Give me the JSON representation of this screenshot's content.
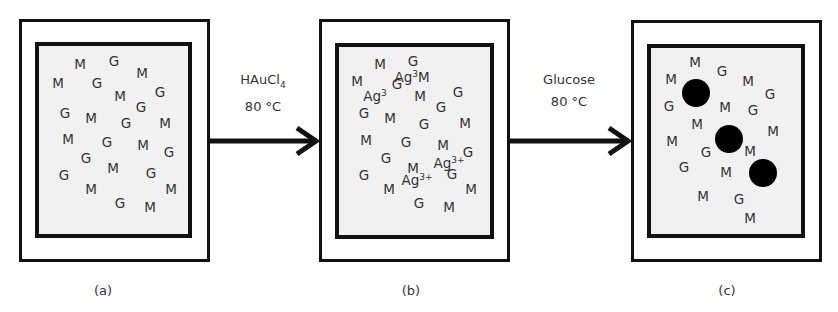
{
  "panels": [
    {
      "caption": "(a)",
      "outer": [
        19,
        19,
        191,
        243
      ],
      "inner": [
        35,
        42,
        157,
        196
      ],
      "items": [
        {
          "t": "M",
          "x": 80,
          "y": 65
        },
        {
          "t": "G",
          "x": 114,
          "y": 62
        },
        {
          "t": "M",
          "x": 142,
          "y": 74
        },
        {
          "t": "M",
          "x": 58,
          "y": 84
        },
        {
          "t": "G",
          "x": 97,
          "y": 84
        },
        {
          "t": "M",
          "x": 120,
          "y": 97
        },
        {
          "t": "G",
          "x": 160,
          "y": 93
        },
        {
          "t": "G",
          "x": 65,
          "y": 114
        },
        {
          "t": "M",
          "x": 91,
          "y": 119
        },
        {
          "t": "G",
          "x": 141,
          "y": 108
        },
        {
          "t": "G",
          "x": 126,
          "y": 124
        },
        {
          "t": "M",
          "x": 165,
          "y": 124
        },
        {
          "t": "M",
          "x": 68,
          "y": 140
        },
        {
          "t": "G",
          "x": 107,
          "y": 143
        },
        {
          "t": "M",
          "x": 143,
          "y": 146
        },
        {
          "t": "G",
          "x": 169,
          "y": 153
        },
        {
          "t": "G",
          "x": 86,
          "y": 159
        },
        {
          "t": "M",
          "x": 113,
          "y": 169
        },
        {
          "t": "G",
          "x": 151,
          "y": 174
        },
        {
          "t": "G",
          "x": 64,
          "y": 176
        },
        {
          "t": "M",
          "x": 91,
          "y": 190
        },
        {
          "t": "M",
          "x": 171,
          "y": 190
        },
        {
          "t": "G",
          "x": 120,
          "y": 204
        },
        {
          "t": "M",
          "x": 150,
          "y": 208
        }
      ],
      "dots": []
    },
    {
      "caption": "(b)",
      "outer": [
        319,
        19,
        191,
        243
      ],
      "inner": [
        335,
        43,
        159,
        196
      ],
      "items": [
        {
          "t": "M",
          "x": 380,
          "y": 65
        },
        {
          "t": "G",
          "x": 413,
          "y": 62
        },
        {
          "t": "M",
          "x": 357,
          "y": 82
        },
        {
          "t": "G",
          "x": 397,
          "y": 85
        },
        {
          "t": "Ag",
          "sup": "3",
          "x": 375,
          "y": 96
        },
        {
          "t": "Ag",
          "sup": "3",
          "after": "M",
          "x": 412,
          "y": 77
        },
        {
          "t": "M",
          "x": 420,
          "y": 97
        },
        {
          "t": "G",
          "x": 458,
          "y": 93
        },
        {
          "t": "G",
          "x": 364,
          "y": 114
        },
        {
          "t": "M",
          "x": 390,
          "y": 119
        },
        {
          "t": "G",
          "x": 441,
          "y": 108
        },
        {
          "t": "G",
          "x": 424,
          "y": 125
        },
        {
          "t": "M",
          "x": 465,
          "y": 124
        },
        {
          "t": "M",
          "x": 366,
          "y": 141
        },
        {
          "t": "G",
          "x": 406,
          "y": 143
        },
        {
          "t": "M",
          "x": 443,
          "y": 146
        },
        {
          "t": "G",
          "x": 468,
          "y": 153
        },
        {
          "t": "G",
          "x": 386,
          "y": 159
        },
        {
          "t": "M",
          "x": 413,
          "y": 169
        },
        {
          "t": "Ag",
          "sup": "3+",
          "x": 449,
          "y": 163
        },
        {
          "t": "G",
          "x": 452,
          "y": 175
        },
        {
          "t": "G",
          "x": 364,
          "y": 176
        },
        {
          "t": "Ag",
          "sup": "3+",
          "x": 417,
          "y": 180
        },
        {
          "t": "M",
          "x": 389,
          "y": 190
        },
        {
          "t": "M",
          "x": 471,
          "y": 190
        },
        {
          "t": "G",
          "x": 419,
          "y": 204
        },
        {
          "t": "M",
          "x": 449,
          "y": 208
        }
      ],
      "dots": []
    },
    {
      "caption": "(c)",
      "outer": [
        631,
        20,
        191,
        242
      ],
      "inner": [
        647,
        44,
        158,
        194
      ],
      "items": [
        {
          "t": "M",
          "x": 695,
          "y": 63
        },
        {
          "t": "G",
          "x": 722,
          "y": 72
        },
        {
          "t": "M",
          "x": 748,
          "y": 82
        },
        {
          "t": "G",
          "x": 770,
          "y": 95
        },
        {
          "t": "M",
          "x": 671,
          "y": 80
        },
        {
          "t": "G",
          "x": 669,
          "y": 107
        },
        {
          "t": "M",
          "x": 725,
          "y": 108
        },
        {
          "t": "G",
          "x": 753,
          "y": 111
        },
        {
          "t": "M",
          "x": 697,
          "y": 125
        },
        {
          "t": "M",
          "x": 773,
          "y": 132
        },
        {
          "t": "M",
          "x": 672,
          "y": 142
        },
        {
          "t": "G",
          "x": 706,
          "y": 153
        },
        {
          "t": "M",
          "x": 750,
          "y": 152
        },
        {
          "t": "G",
          "x": 684,
          "y": 168
        },
        {
          "t": "M",
          "x": 726,
          "y": 173
        },
        {
          "t": "M",
          "x": 703,
          "y": 197
        },
        {
          "t": "G",
          "x": 739,
          "y": 200
        },
        {
          "t": "M",
          "x": 750,
          "y": 219
        }
      ],
      "dots": [
        {
          "x": 696,
          "y": 93,
          "r": 14
        },
        {
          "x": 729,
          "y": 139,
          "r": 14
        },
        {
          "x": 763,
          "y": 173,
          "r": 14
        }
      ]
    }
  ],
  "arrows": [
    {
      "x1": 210,
      "x2": 318,
      "y": 141,
      "label_line1": "HAuCl",
      "label_sub": "4",
      "label_line2": "80 °C",
      "label_x": 263,
      "label_y": 80
    },
    {
      "x1": 510,
      "x2": 630,
      "y": 141,
      "label_line1": "Glucose",
      "label_sub": "",
      "label_line2": "80 °C",
      "label_x": 569,
      "label_y": 80
    }
  ],
  "captions": [
    {
      "text": "(a)",
      "x": 103,
      "y": 290
    },
    {
      "text": "(b)",
      "x": 411,
      "y": 290
    },
    {
      "text": "(c)",
      "x": 727,
      "y": 290
    }
  ],
  "colors": {
    "stroke": "#111111",
    "fill": "#f1f1f1",
    "text": "#333333"
  }
}
